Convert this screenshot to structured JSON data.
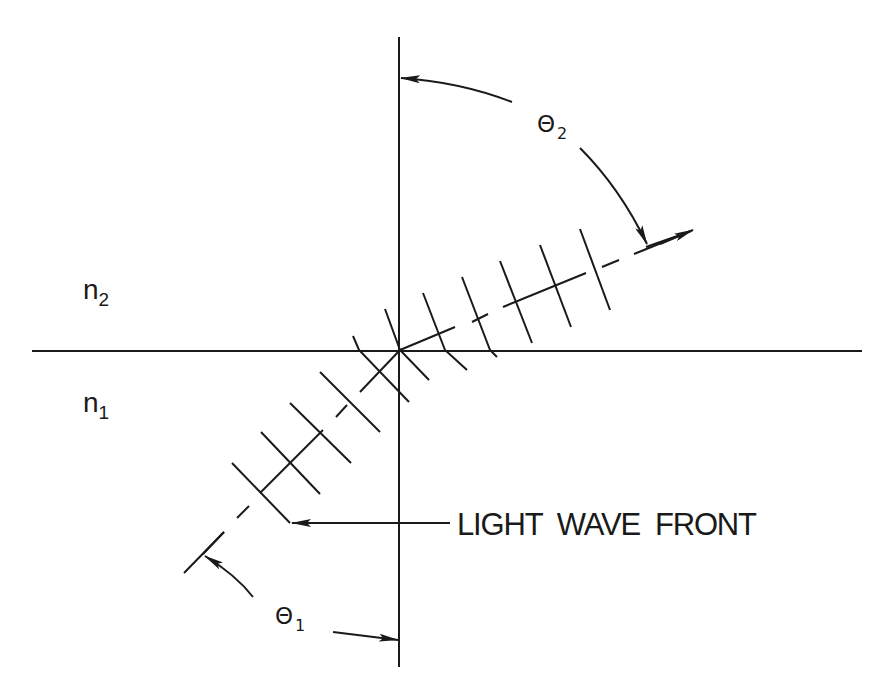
{
  "diagram": {
    "colors": {
      "line": "#1a1a1a",
      "background": "#ffffff"
    },
    "labels": {
      "medium_upper": {
        "base": "n",
        "sub": "2"
      },
      "medium_lower": {
        "base": "n",
        "sub": "1"
      },
      "angle_refracted": {
        "base": "Θ",
        "sub": "2"
      },
      "angle_incident": {
        "base": "Θ",
        "sub": "1"
      },
      "wave_front": "LIGHT  WAVE  FRONT"
    },
    "axes": {
      "normal": {
        "x1": 399,
        "y1": 37,
        "x2": 399,
        "y2": 667
      },
      "interface": {
        "x1": 32,
        "y1": 351,
        "x2": 862,
        "y2": 351
      }
    },
    "incident_ray_segments": [
      [
        400,
        350,
        360,
        392
      ],
      [
        347,
        405,
        336,
        417
      ],
      [
        323,
        430,
        260,
        493
      ],
      [
        249,
        506,
        237,
        518
      ],
      [
        224,
        532,
        203,
        554
      ]
    ],
    "refracted_ray_segments": [
      [
        400,
        350,
        455,
        327
      ],
      [
        472,
        322,
        488,
        314
      ],
      [
        503,
        307,
        586,
        273
      ],
      [
        602,
        267,
        619,
        260
      ],
      [
        634,
        254,
        691,
        231
      ]
    ],
    "incident_wavefronts": [
      [
        184,
        573,
        224,
        532
      ],
      [
        232,
        463,
        290,
        523
      ],
      [
        261,
        432,
        320,
        494
      ],
      [
        290,
        403,
        351,
        463
      ],
      [
        320,
        372,
        380,
        432
      ],
      [
        353,
        336,
        359,
        350,
        409,
        402
      ],
      [
        385,
        309,
        400,
        350,
        429,
        380
      ],
      [
        423,
        293,
        445,
        350,
        467,
        370
      ],
      [
        462,
        277,
        490,
        350,
        497,
        357
      ]
    ],
    "refracted_wavefronts": [
      [
        500,
        261,
        532,
        343
      ],
      [
        540,
        245,
        571,
        327
      ],
      [
        580,
        229,
        610,
        310
      ],
      [
        646,
        247,
        683,
        234
      ]
    ],
    "wavefront_pointer": {
      "x1": 450,
      "y1": 523,
      "x2": 292,
      "y2": 523
    },
    "angle_arcs": {
      "theta2_upper": "M 512 102 Q 460 82 401 78",
      "theta2_lower": "M 580 148 Q 620 188 647 244",
      "theta1_upper": "M 253 597 Q 236 575 205 556",
      "theta1_lower": "M 333 632 Q 366 636 398 640"
    }
  }
}
